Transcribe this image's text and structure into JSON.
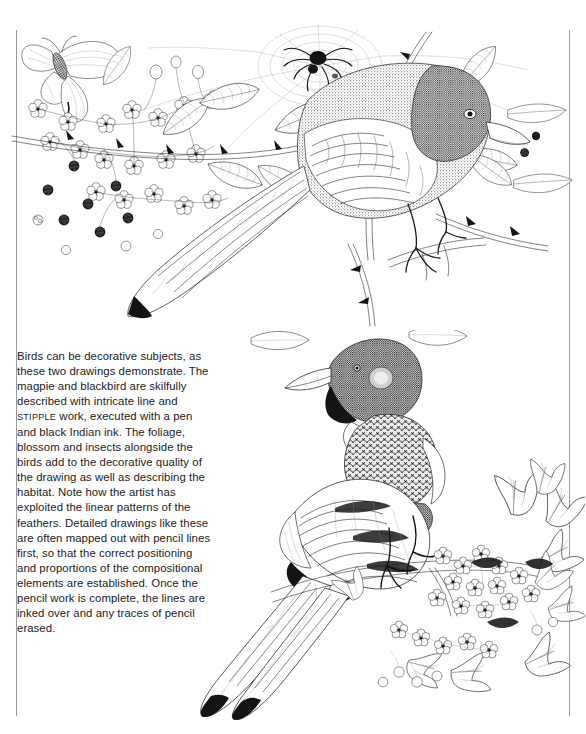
{
  "page": {
    "background_color": "#ffffff",
    "width": 586,
    "height": 734,
    "rule_color": "#9a9a9a"
  },
  "caption": {
    "text": "Birds can be decorative subjects, as these two drawings demonstrate. The magpie and blackbird are skilfully described with intricate line and ",
    "smallcaps_word": "STIPPLE",
    "text_after": " work, executed with a pen and black Indian ink. The foliage, blossom and insects alongside the birds add to the decorative quality of the drawing as well as describing the habitat. Note how the artist has exploited the linear patterns of the feathers. Detailed drawings like these are often mapped out with pencil lines first, so that the correct positioning and proportions of the compositional elements are established. Once the pencil work is complete, the lines are inked over and any traces of pencil erased.",
    "text_color": "#222222"
  },
  "illustrations": [
    {
      "name": "blackbird-drawing",
      "subject": "blackbird perched on a bramble branch",
      "elements": [
        "blackbird",
        "bramble leaves",
        "blackberries",
        "blossom",
        "butterfly",
        "spider",
        "spider-web",
        "thorned stems"
      ],
      "medium": "pen and black Indian ink",
      "ink_color": "#1b1b1b"
    },
    {
      "name": "magpie-drawing",
      "subject": "magpie perched on a hawthorn branch",
      "elements": [
        "magpie",
        "long tail feathers",
        "hawthorn leaves",
        "hawthorn blossom",
        "berries",
        "branch"
      ],
      "medium": "pen and black Indian ink",
      "ink_color": "#1b1b1b"
    }
  ]
}
